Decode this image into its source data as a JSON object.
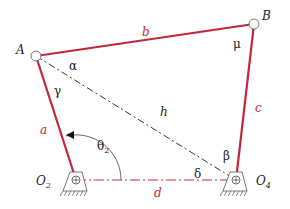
{
  "diagram": {
    "colors": {
      "link": "#c0283a",
      "construction": "#333333",
      "ground_line": "#c0283a",
      "text": "#222222"
    },
    "points": {
      "A": {
        "label": "A",
        "x": 36,
        "y": 56
      },
      "B": {
        "label": "B",
        "x": 254,
        "y": 24
      },
      "O2": {
        "label": "O",
        "sub": "2",
        "x": 76,
        "y": 180
      },
      "O4": {
        "label": "O",
        "sub": "4",
        "x": 236,
        "y": 180
      }
    },
    "links": {
      "a": {
        "label": "a"
      },
      "b": {
        "label": "b"
      },
      "c": {
        "label": "c"
      },
      "d": {
        "label": "d"
      },
      "h": {
        "label": "h"
      }
    },
    "angles": {
      "alpha": "α",
      "gamma": "γ",
      "mu": "μ",
      "beta": "β",
      "delta": "δ",
      "theta2": {
        "symbol": "θ",
        "sub": "2"
      }
    }
  }
}
